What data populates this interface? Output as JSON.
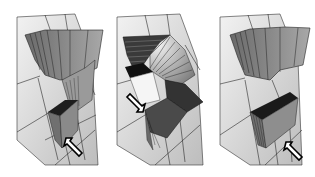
{
  "figure": {
    "panels": [
      {
        "id": "left",
        "arrow_direction": "up-left",
        "arrow_label": ""
      },
      {
        "id": "middle",
        "arrow_direction": "down-right",
        "arrow_label": ""
      },
      {
        "id": "right",
        "arrow_direction": "up-left",
        "arrow_label": ""
      }
    ],
    "colors": {
      "background": "#ffffff",
      "surface_light": "#e6e6e6",
      "surface_mid": "#bdbdbd",
      "block_gray": "#8c8c8c",
      "block_dark": "#1e1e1e",
      "grid_line": "#2a2a2a"
    }
  }
}
